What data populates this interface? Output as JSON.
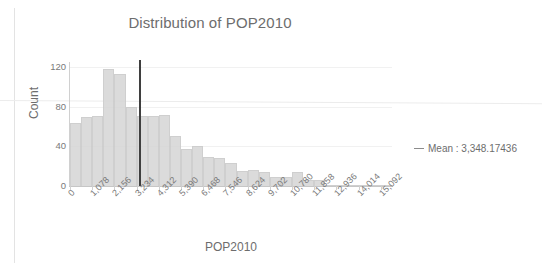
{
  "chart_data": {
    "type": "bar",
    "title": "Distribution of POP2010",
    "xlabel": "POP2010",
    "ylabel": "Count",
    "ylim": [
      0,
      125
    ],
    "yticks": [
      0,
      40,
      80,
      120
    ],
    "ytick_labels": [
      "0",
      "40",
      "80",
      "120"
    ],
    "grid": true,
    "legend_position": "right",
    "bin_width": 539,
    "x_start": 0,
    "categories": [
      "0",
      "539",
      "1,078",
      "1,617",
      "2,156",
      "2,695",
      "3,234",
      "3,773",
      "4,312",
      "4,851",
      "5,390",
      "5,929",
      "6,468",
      "7,007",
      "7,546",
      "8,085",
      "8,624",
      "9,163",
      "9,702",
      "10,241",
      "10,780",
      "11,319",
      "11,858",
      "12,397",
      "12,936",
      "13,475",
      "14,014",
      "14,553",
      "15,092"
    ],
    "values": [
      64,
      70,
      71,
      118,
      113,
      80,
      71,
      71,
      72,
      50,
      37,
      40,
      29,
      28,
      23,
      15,
      16,
      14,
      9,
      9,
      14,
      6,
      6,
      1,
      1,
      1,
      1,
      1,
      1
    ],
    "xtick_labels": [
      "0",
      "1,078",
      "2,156",
      "3,234",
      "4,312",
      "5,390",
      "6,468",
      "7,546",
      "8,624",
      "9,702",
      "10,780",
      "11,858",
      "12,936",
      "14,014",
      "15,092"
    ],
    "xtick_values": [
      0,
      1078,
      2156,
      3234,
      4312,
      5390,
      6468,
      7546,
      8624,
      9702,
      10780,
      11858,
      12936,
      14014,
      15092
    ],
    "annotations": [
      {
        "name": "mean-line",
        "type": "vline",
        "value": 3348.17436,
        "label": "Mean : 3,348.17436",
        "color": "#3f3f3f"
      }
    ],
    "legend": [
      {
        "label": "Mean : 3,348.17436",
        "marker": "line",
        "color": "#8c8c8c"
      }
    ],
    "colors": {
      "bar_fill": "#d8d8d8",
      "bar_border": "#cccccc",
      "mean_line": "#3f3f3f",
      "axis": "#c6c6c6",
      "text": "#6d6d6d",
      "gridline": "#f1f1f1"
    }
  }
}
